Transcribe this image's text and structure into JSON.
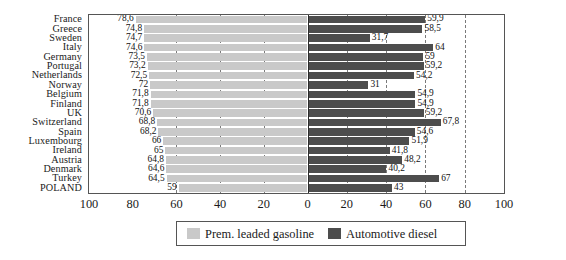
{
  "chart_data": {
    "type": "bar",
    "subtype": "diverging-horizontal-bar",
    "title": "",
    "xlabel": "",
    "ylabel": "",
    "grid": true,
    "legend_position": "bottom",
    "axis": {
      "left_ticks": [
        100,
        80,
        60,
        40,
        20,
        0
      ],
      "right_ticks": [
        0,
        20,
        40,
        60,
        80,
        100
      ],
      "tick_labels": [
        "100",
        "80",
        "60",
        "40",
        "20",
        "0",
        "20",
        "40",
        "60",
        "80",
        "100"
      ],
      "left_range": [
        100,
        0
      ],
      "right_range": [
        0,
        100
      ],
      "gridlines_left": [
        60,
        40,
        20
      ],
      "gridlines_right": [
        20,
        40,
        60,
        80
      ]
    },
    "categories": [
      "France",
      "Greece",
      "Sweden",
      "Italy",
      "Germany",
      "Portugal",
      "Netherlands",
      "Norway",
      "Belgium",
      "Finland",
      "UK",
      "Switzerland",
      "Spain",
      "Luxembourg",
      "Ireland",
      "Austria",
      "Denmark",
      "Turkey",
      "POLAND"
    ],
    "series": [
      {
        "name": "Prem. leaded gasoline",
        "color": "#c9c9c9",
        "side": "left",
        "values": [
          78.6,
          74.8,
          74.7,
          74.6,
          73.5,
          73.2,
          72.5,
          72,
          71.8,
          71.8,
          70.6,
          68.8,
          68.2,
          66,
          65,
          64.8,
          64.6,
          64.5,
          59
        ],
        "labels": [
          "78,6",
          "74,8",
          "74,7",
          "74,6",
          "73,5",
          "73,2",
          "72,5",
          "72",
          "71,8",
          "71,8",
          "70,6",
          "68,8",
          "68,2",
          "66",
          "65",
          "64,8",
          "64,6",
          "64,5",
          "59"
        ]
      },
      {
        "name": "Automotive diesel",
        "color": "#4d4d4d",
        "side": "right",
        "values": [
          59.9,
          58.5,
          31.7,
          64,
          59,
          59.2,
          54.2,
          31,
          54.9,
          54.9,
          59.2,
          67.8,
          54.6,
          51.9,
          41.8,
          48.2,
          40.2,
          67,
          43
        ],
        "labels": [
          "59,9",
          "58,5",
          "31,7",
          "64",
          "59",
          "59,2",
          "54,2",
          "31",
          "54,9",
          "54,9",
          "59,2",
          "67,8",
          "54,6",
          "51,9",
          "41,8",
          "48,2",
          "40,2",
          "67",
          "43"
        ]
      }
    ]
  },
  "legend": {
    "items": [
      {
        "label": "Prem. leaded gasoline",
        "color": "#c9c9c9",
        "swatch_name": "legend-swatch-gasoline"
      },
      {
        "label": "Automotive diesel",
        "color": "#4d4d4d",
        "swatch_name": "legend-swatch-diesel"
      }
    ]
  },
  "colors": {
    "gasoline": "#c9c9c9",
    "diesel": "#4d4d4d",
    "frame": "#555555",
    "gridline": "#7a7a7a",
    "zeroline": "#2b2b2b",
    "background": "#ffffff",
    "text": "#1a1a1a"
  }
}
